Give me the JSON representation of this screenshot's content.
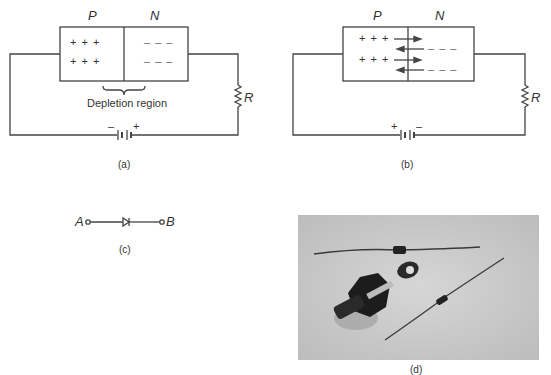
{
  "figure_a": {
    "label_p": "P",
    "label_n": "N",
    "p_charges": [
      "+ + +",
      "+ + +"
    ],
    "n_charges": [
      "– – –",
      "– – –"
    ],
    "depletion_label": "Depletion region",
    "resistor_label": "R",
    "battery_left": "–",
    "battery_right": "+",
    "caption": "(a)"
  },
  "figure_b": {
    "label_p": "P",
    "label_n": "N",
    "p_charges": [
      "+ + +",
      "+ + +"
    ],
    "n_charges": [
      "– – –",
      "– – –"
    ],
    "resistor_label": "R",
    "battery_left": "+",
    "battery_right": "–",
    "caption": "(b)"
  },
  "figure_c": {
    "terminal_a": "A",
    "terminal_b": "B",
    "caption": "(c)"
  },
  "figure_d": {
    "caption": "(d)",
    "description": "Photograph of three diodes: two axial-lead diodes and one stud-mount power diode"
  }
}
